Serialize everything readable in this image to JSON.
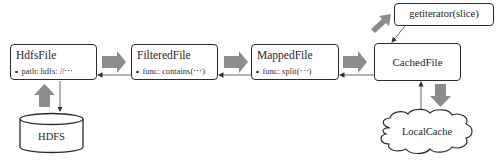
{
  "diagram": {
    "nodes": {
      "hdfs_file": {
        "title": "HdfsFile",
        "property": "path: hdfs: //⋯"
      },
      "filtered_file": {
        "title": "FilteredFile",
        "property": "func: contains(⋯)"
      },
      "mapped_file": {
        "title": "MappedFile",
        "property": "func: split(⋯)"
      },
      "cached_file": {
        "title": "CachedFile"
      },
      "get_iterator": {
        "title": "getiterator(slice)"
      },
      "hdfs_store": {
        "title": "HDFS",
        "shape": "cylinder"
      },
      "local_cache": {
        "title": "LocalCache",
        "shape": "cloud"
      }
    },
    "flow_arrows": [
      {
        "from": "HDFS",
        "to": "HdfsFile",
        "style": "thick-gray"
      },
      {
        "from": "HdfsFile",
        "to": "FilteredFile",
        "style": "thick-gray"
      },
      {
        "from": "FilteredFile",
        "to": "MappedFile",
        "style": "thick-gray"
      },
      {
        "from": "MappedFile",
        "to": "CachedFile",
        "style": "thick-gray"
      },
      {
        "from": "CachedFile",
        "to": "getiterator(slice)",
        "style": "thick-gray"
      },
      {
        "from": "CachedFile",
        "to": "LocalCache",
        "style": "thick-gray"
      }
    ],
    "dependency_arrows": [
      {
        "from": "FilteredFile",
        "to": "HdfsFile",
        "style": "thin"
      },
      {
        "from": "MappedFile",
        "to": "FilteredFile",
        "style": "thin"
      },
      {
        "from": "CachedFile",
        "to": "MappedFile",
        "style": "thin"
      },
      {
        "from": "getiterator(slice)",
        "to": "CachedFile",
        "style": "thin"
      },
      {
        "from": "HdfsFile",
        "to": "HDFS",
        "style": "thin"
      },
      {
        "from": "LocalCache",
        "to": "CachedFile",
        "style": "thin"
      }
    ],
    "colors": {
      "thick_arrow": "#8c8c8c",
      "thin_arrow": "#555555",
      "border": "#2b2b2b"
    }
  }
}
